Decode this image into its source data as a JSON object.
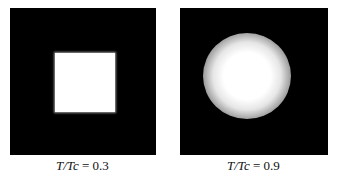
{
  "figure": {
    "panels": [
      {
        "id": "left",
        "shape": "sharp white square",
        "caption_var": "T/",
        "caption_var2": "Tc",
        "caption_value": " = 0.3"
      },
      {
        "id": "right",
        "shape": "blurred white circle",
        "caption_var": "T/",
        "caption_var2": "Tc",
        "caption_value": " = 0.9"
      }
    ],
    "colors": {
      "background": "#000000",
      "feature": "#ffffff"
    }
  }
}
